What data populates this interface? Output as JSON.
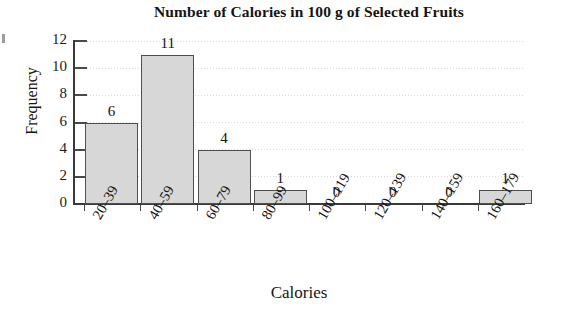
{
  "chart_data": {
    "type": "bar",
    "title": "Number of Calories in 100 g of Selected Fruits",
    "xlabel": "Calories",
    "ylabel": "Frequency",
    "categories": [
      "20–39",
      "40–59",
      "60–79",
      "80–99",
      "100–119",
      "120–139",
      "140–159",
      "160–179"
    ],
    "values": [
      6,
      11,
      4,
      1,
      0,
      0,
      0,
      1
    ],
    "value_labels": [
      "6",
      "11",
      "4",
      "1",
      "0",
      "0",
      "0",
      "1"
    ],
    "ylim": [
      0,
      12
    ],
    "yticks": [
      0,
      2,
      4,
      6,
      8,
      10,
      12
    ],
    "ytick_labels": [
      "0",
      "2",
      "4",
      "6",
      "8",
      "10",
      "12"
    ],
    "grid": "horizontal-dotted",
    "legend": "none",
    "bar_fill_color": "#d7d7d7",
    "bar_edge_color": "#4e4e4e",
    "axis_color": "#3a3a3a",
    "text_color": "#141414"
  }
}
